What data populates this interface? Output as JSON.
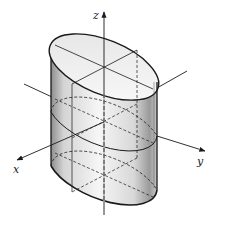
{
  "figure": {
    "axes": {
      "x_label": "x",
      "y_label": "y",
      "z_label": "z"
    },
    "colors": {
      "stroke": "#1a1a1a",
      "surface_light": "#f4f4f4",
      "surface_dark": "#9a9a9a",
      "background": "#ffffff"
    }
  }
}
